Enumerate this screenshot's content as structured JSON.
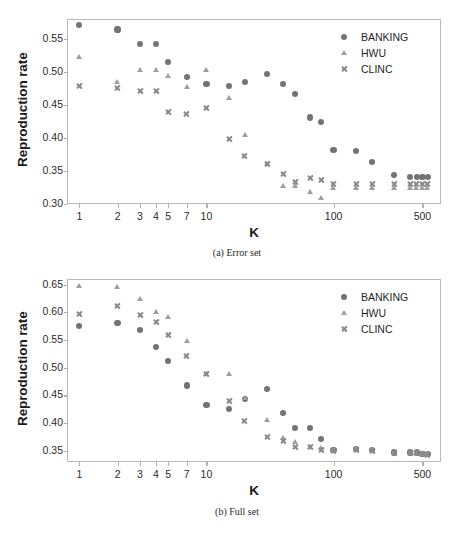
{
  "figure": {
    "panels": [
      {
        "id": "a",
        "caption": "(a) Error set",
        "ylabel": "Reproduction rate",
        "xlabel": "K",
        "yticks": [
          "0.30",
          "0.35",
          "0.40",
          "0.45",
          "0.50",
          "0.55"
        ],
        "xticks": [
          "1",
          "2",
          "3",
          "4",
          "5",
          "7",
          "10",
          "100",
          "500"
        ]
      },
      {
        "id": "b",
        "caption": "(b) Full set",
        "ylabel": "Reproduction rate",
        "xlabel": "K",
        "yticks": [
          "0.35",
          "0.40",
          "0.45",
          "0.50",
          "0.55",
          "0.60",
          "0.65"
        ],
        "xticks": [
          "1",
          "2",
          "3",
          "4",
          "5",
          "7",
          "10",
          "100",
          "500"
        ]
      }
    ],
    "legend": {
      "entries": [
        {
          "label": "BANKING",
          "marker": "circle-marker",
          "color": "#737373"
        },
        {
          "label": "HWU",
          "marker": "triangle-marker",
          "color": "#9e9e9e"
        },
        {
          "label": "CLINC",
          "marker": "x-marker",
          "color": "#8a8a8a"
        }
      ]
    }
  },
  "chart_data": [
    {
      "type": "scatter",
      "title": "(a) Error set",
      "xlabel": "K",
      "ylabel": "Reproduction rate",
      "xscale": "log",
      "xlim": [
        0.8,
        700
      ],
      "ylim": [
        0.3,
        0.58
      ],
      "xticks": [
        1,
        2,
        3,
        4,
        5,
        7,
        10,
        100,
        500
      ],
      "yticks": [
        0.3,
        0.35,
        0.4,
        0.45,
        0.5,
        0.55
      ],
      "grid": false,
      "legend_position": "upper-right",
      "series": [
        {
          "name": "BANKING",
          "marker": "circle",
          "color": "#737373",
          "x": [
            1,
            2,
            3,
            4,
            5,
            7,
            10,
            15,
            20,
            30,
            40,
            50,
            65,
            80,
            100,
            150,
            200,
            300,
            400,
            450,
            500,
            550
          ],
          "y": [
            0.571,
            0.564,
            0.542,
            0.542,
            0.515,
            0.492,
            0.481,
            0.478,
            0.485,
            0.497,
            0.481,
            0.467,
            0.431,
            0.424,
            0.382,
            0.38,
            0.364,
            0.344,
            0.341,
            0.341,
            0.341,
            0.341
          ]
        },
        {
          "name": "HWU",
          "marker": "triangle",
          "color": "#9e9e9e",
          "x": [
            1,
            2,
            3,
            4,
            5,
            7,
            10,
            15,
            20,
            30,
            40,
            50,
            65,
            80,
            100,
            150,
            200,
            300,
            400,
            450,
            500,
            550
          ],
          "y": [
            0.522,
            0.485,
            0.503,
            0.503,
            0.494,
            0.477,
            0.503,
            0.46,
            0.405,
            0.36,
            0.327,
            0.327,
            0.318,
            0.309,
            0.324,
            0.325,
            0.325,
            0.325,
            0.325,
            0.325,
            0.325,
            0.325
          ]
        },
        {
          "name": "CLINC",
          "marker": "x",
          "color": "#8a8a8a",
          "x": [
            1,
            2,
            3,
            4,
            5,
            7,
            10,
            15,
            20,
            30,
            40,
            50,
            65,
            80,
            100,
            150,
            200,
            300,
            400,
            450,
            500,
            550
          ],
          "y": [
            0.478,
            0.476,
            0.471,
            0.471,
            0.44,
            0.437,
            0.446,
            0.398,
            0.373,
            0.361,
            0.345,
            0.334,
            0.34,
            0.337,
            0.33,
            0.33,
            0.33,
            0.331,
            0.331,
            0.331,
            0.331,
            0.331
          ]
        }
      ]
    },
    {
      "type": "scatter",
      "title": "(b) Full set",
      "xlabel": "K",
      "ylabel": "Reproduction rate",
      "xscale": "log",
      "xlim": [
        0.8,
        700
      ],
      "ylim": [
        0.33,
        0.66
      ],
      "xticks": [
        1,
        2,
        3,
        4,
        5,
        7,
        10,
        100,
        500
      ],
      "yticks": [
        0.35,
        0.4,
        0.45,
        0.5,
        0.55,
        0.6,
        0.65
      ],
      "grid": false,
      "legend_position": "upper-right",
      "series": [
        {
          "name": "BANKING",
          "marker": "circle",
          "color": "#737373",
          "x": [
            1,
            2,
            3,
            4,
            5,
            7,
            10,
            15,
            20,
            30,
            40,
            50,
            65,
            80,
            100,
            150,
            200,
            300,
            400,
            450,
            500,
            550
          ],
          "y": [
            0.575,
            0.58,
            0.568,
            0.538,
            0.512,
            0.468,
            0.433,
            0.426,
            0.444,
            0.462,
            0.418,
            0.392,
            0.392,
            0.372,
            0.351,
            0.353,
            0.351,
            0.347,
            0.347,
            0.347,
            0.345,
            0.344
          ]
        },
        {
          "name": "HWU",
          "marker": "triangle",
          "color": "#9e9e9e",
          "x": [
            1,
            2,
            3,
            4,
            5,
            7,
            10,
            15,
            20,
            30,
            40,
            50,
            65,
            80,
            100,
            150,
            200,
            300,
            400,
            450,
            500,
            550
          ],
          "y": [
            0.648,
            0.645,
            0.624,
            0.601,
            0.592,
            0.548,
            0.489,
            0.489,
            0.445,
            0.405,
            0.374,
            0.366,
            0.358,
            0.355,
            0.352,
            0.353,
            0.351,
            0.347,
            0.347,
            0.347,
            0.346,
            0.345
          ]
        },
        {
          "name": "CLINC",
          "marker": "x",
          "color": "#8a8a8a",
          "x": [
            1,
            2,
            3,
            4,
            5,
            7,
            10,
            15,
            20,
            30,
            40,
            50,
            65,
            80,
            100,
            150,
            200,
            300,
            400,
            450,
            500,
            550
          ],
          "y": [
            0.597,
            0.611,
            0.595,
            0.583,
            0.559,
            0.522,
            0.489,
            0.44,
            0.404,
            0.376,
            0.368,
            0.357,
            0.357,
            0.352,
            0.35,
            0.352,
            0.35,
            0.347,
            0.346,
            0.346,
            0.344,
            0.343
          ]
        }
      ]
    }
  ]
}
